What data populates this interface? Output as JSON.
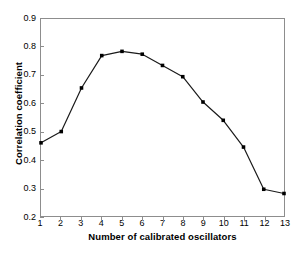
{
  "chart_data": {
    "type": "line",
    "title": "",
    "subtitle": "",
    "xlabel": "Number of calibrated oscillators",
    "ylabel": "Correlation coefficient",
    "x": [
      1,
      2,
      3,
      4,
      5,
      6,
      7,
      8,
      9,
      10,
      11,
      12,
      13
    ],
    "values": [
      0.46,
      0.5,
      0.655,
      0.77,
      0.785,
      0.775,
      0.735,
      0.695,
      0.605,
      0.54,
      0.445,
      0.295,
      0.28
    ],
    "series": [
      {
        "name": "Correlation coefficient",
        "values": [
          0.46,
          0.5,
          0.655,
          0.77,
          0.785,
          0.775,
          0.735,
          0.695,
          0.605,
          0.54,
          0.445,
          0.295,
          0.28
        ]
      }
    ],
    "xlim": [
      1,
      13
    ],
    "ylim": [
      0.2,
      0.9
    ],
    "xticks": [
      "1",
      "2",
      "3",
      "4",
      "5",
      "6",
      "7",
      "8",
      "9",
      "10",
      "11",
      "12",
      "13"
    ],
    "yticks": [
      "0.2",
      "0.3",
      "0.4",
      "0.5",
      "0.6",
      "0.7",
      "0.8",
      "0.9"
    ],
    "ytick_values": [
      0.2,
      0.3,
      0.4,
      0.5,
      0.6,
      0.7,
      0.8,
      0.9
    ],
    "grid": false,
    "legend": false,
    "legend_position": "none",
    "marker": "filled-square",
    "line_color": "#1a1a1a",
    "marker_color": "#000000",
    "axis_color": "#8d8d8d",
    "background_color": "#ffffff"
  }
}
